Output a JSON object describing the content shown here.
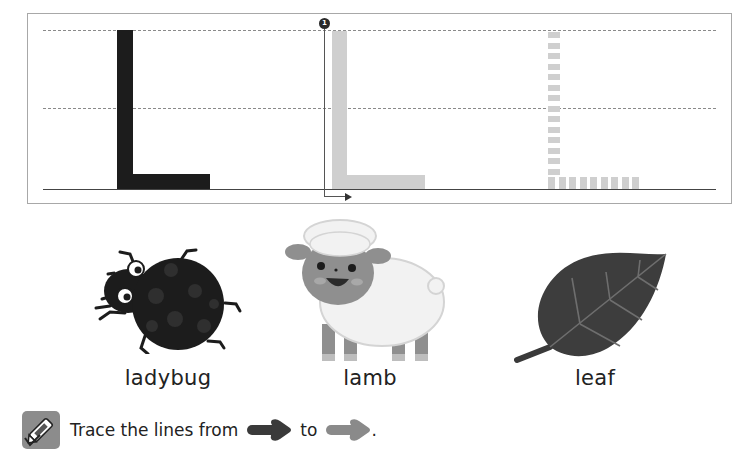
{
  "worksheet": {
    "letter": "L",
    "tracing_panel": {
      "models": [
        {
          "style": "solid-black",
          "letter": "L"
        },
        {
          "style": "solid-gray-guided",
          "letter": "L",
          "start_marker": "1"
        },
        {
          "style": "dashed-gray",
          "letter": "L"
        }
      ],
      "guide_lines": [
        "top-dashed",
        "middle-dashed",
        "baseline-solid"
      ]
    },
    "pictures": [
      {
        "icon": "ladybug-icon",
        "label": "ladybug"
      },
      {
        "icon": "lamb-icon",
        "label": "lamb"
      },
      {
        "icon": "leaf-icon",
        "label": "leaf"
      }
    ],
    "instruction": {
      "icon": "crayon-icon",
      "text_before": "Trace the lines from",
      "text_middle": "to",
      "text_end": ".",
      "start_arrow_color": "#3a3a3a",
      "end_arrow_color": "#8a8a8a"
    }
  },
  "colors": {
    "solid_letter": "#1c1c1c",
    "trace_letter": "#cfcfcf",
    "frame": "#a8a8a8"
  }
}
